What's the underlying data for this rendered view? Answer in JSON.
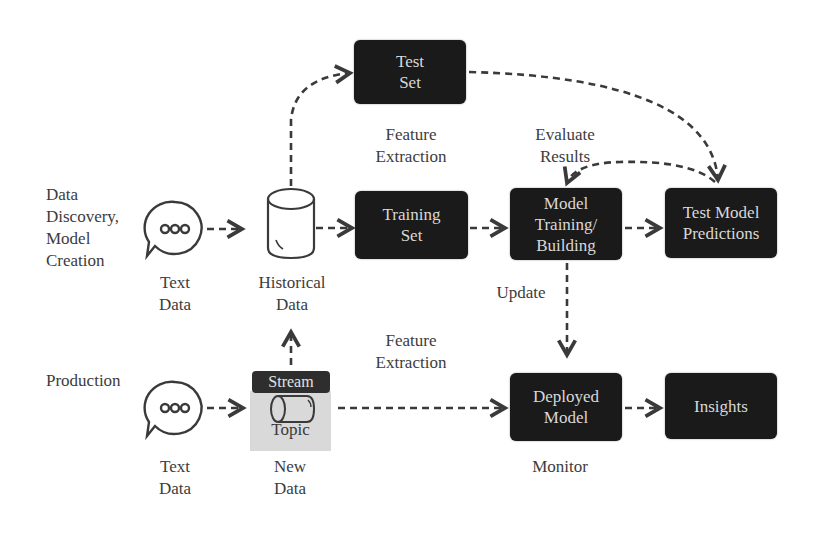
{
  "diagram": {
    "rows": {
      "top_label": "Data\nDiscovery,\nModel\nCreation",
      "bottom_label": "Production"
    },
    "sources": {
      "text_data_top": "Text\nData",
      "text_data_bottom": "Text\nData",
      "historical_data": "Historical\nData",
      "new_data": "New\nData",
      "stream": "Stream",
      "topic": "Topic"
    },
    "boxes": {
      "test_set": "Test\nSet",
      "training_set": "Training\nSet",
      "model_training": "Model\nTraining/\nBuilding",
      "test_predictions": "Test Model\nPredictions",
      "deployed_model": "Deployed\nModel",
      "insights": "Insights"
    },
    "edge_labels": {
      "feature_extraction_top": "Feature\nExtraction",
      "evaluate_results": "Evaluate\nResults",
      "update": "Update",
      "feature_extraction_bottom": "Feature\nExtraction",
      "monitor": "Monitor"
    },
    "colors": {
      "box_fill": "#1a1a1a",
      "box_text": "#d8d8d8",
      "arrow": "#3a3a3a",
      "topic_fill": "#d9d9d9"
    }
  }
}
